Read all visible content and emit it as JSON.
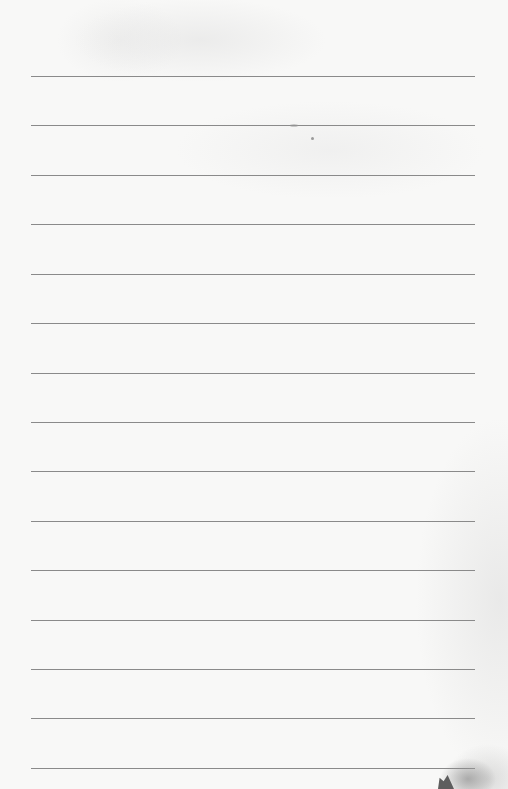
{
  "page": {
    "type": "ruled-notebook-page",
    "background_color": "#f8f8f7",
    "line_color": "#8a8a8a",
    "line_count": 15,
    "lines": [
      {
        "index": 1,
        "y": 76
      },
      {
        "index": 2,
        "y": 125
      },
      {
        "index": 3,
        "y": 175
      },
      {
        "index": 4,
        "y": 224
      },
      {
        "index": 5,
        "y": 274
      },
      {
        "index": 6,
        "y": 323
      },
      {
        "index": 7,
        "y": 373
      },
      {
        "index": 8,
        "y": 422
      },
      {
        "index": 9,
        "y": 471
      },
      {
        "index": 10,
        "y": 521
      },
      {
        "index": 11,
        "y": 570
      },
      {
        "index": 12,
        "y": 620
      },
      {
        "index": 13,
        "y": 669
      },
      {
        "index": 14,
        "y": 718
      },
      {
        "index": 15,
        "y": 768
      }
    ],
    "text": ""
  }
}
